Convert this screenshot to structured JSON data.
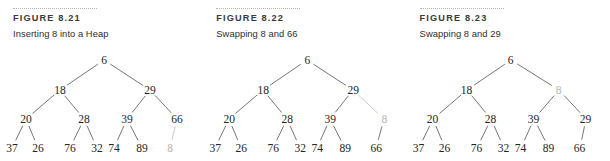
{
  "page": {
    "background_color": "#ffffff",
    "ink_color": "#232323",
    "ghost_color": "#b6b2ad",
    "edge_color": "#5d5d5d",
    "rule_color": "#b9b4ac"
  },
  "figures": [
    {
      "label": "FIGURE 8.21",
      "caption": "Inserting 8 into a Heap",
      "tree": {
        "nodes": [
          {
            "id": "n0",
            "value": "6",
            "x": 104,
            "y": 8,
            "ghost": false
          },
          {
            "id": "n1",
            "value": "18",
            "x": 60,
            "y": 38,
            "ghost": false
          },
          {
            "id": "n2",
            "value": "29",
            "x": 150,
            "y": 38,
            "ghost": false
          },
          {
            "id": "n3",
            "value": "20",
            "x": 26,
            "y": 67,
            "ghost": false
          },
          {
            "id": "n4",
            "value": "28",
            "x": 84,
            "y": 67,
            "ghost": false
          },
          {
            "id": "n5",
            "value": "39",
            "x": 127,
            "y": 67,
            "ghost": false
          },
          {
            "id": "n6",
            "value": "66",
            "x": 177,
            "y": 67,
            "ghost": false
          },
          {
            "id": "n7",
            "value": "37",
            "x": 12,
            "y": 96,
            "ghost": false
          },
          {
            "id": "n8",
            "value": "26",
            "x": 38,
            "y": 96,
            "ghost": false
          },
          {
            "id": "n9",
            "value": "76",
            "x": 70,
            "y": 96,
            "ghost": false
          },
          {
            "id": "n10",
            "value": "32",
            "x": 97,
            "y": 96,
            "ghost": false
          },
          {
            "id": "n11",
            "value": "74",
            "x": 114,
            "y": 96,
            "ghost": false
          },
          {
            "id": "n12",
            "value": "89",
            "x": 142,
            "y": 96,
            "ghost": false
          },
          {
            "id": "n13",
            "value": "8",
            "x": 170,
            "y": 96,
            "ghost": true
          }
        ],
        "edges": [
          {
            "from": "n0",
            "to": "n1",
            "ghost": false
          },
          {
            "from": "n0",
            "to": "n2",
            "ghost": false
          },
          {
            "from": "n1",
            "to": "n3",
            "ghost": false
          },
          {
            "from": "n1",
            "to": "n4",
            "ghost": false
          },
          {
            "from": "n2",
            "to": "n5",
            "ghost": false
          },
          {
            "from": "n2",
            "to": "n6",
            "ghost": false
          },
          {
            "from": "n3",
            "to": "n7",
            "ghost": false
          },
          {
            "from": "n3",
            "to": "n8",
            "ghost": false
          },
          {
            "from": "n4",
            "to": "n9",
            "ghost": false
          },
          {
            "from": "n4",
            "to": "n10",
            "ghost": false
          },
          {
            "from": "n5",
            "to": "n11",
            "ghost": false
          },
          {
            "from": "n5",
            "to": "n12",
            "ghost": false
          },
          {
            "from": "n6",
            "to": "n13",
            "ghost": true
          }
        ]
      }
    },
    {
      "label": "FIGURE 8.22",
      "caption": "Swapping 8 and 66",
      "tree": {
        "nodes": [
          {
            "id": "n0",
            "value": "6",
            "x": 104,
            "y": 8,
            "ghost": false
          },
          {
            "id": "n1",
            "value": "18",
            "x": 60,
            "y": 38,
            "ghost": false
          },
          {
            "id": "n2",
            "value": "29",
            "x": 150,
            "y": 38,
            "ghost": false
          },
          {
            "id": "n3",
            "value": "20",
            "x": 26,
            "y": 67,
            "ghost": false
          },
          {
            "id": "n4",
            "value": "28",
            "x": 84,
            "y": 67,
            "ghost": false
          },
          {
            "id": "n5",
            "value": "39",
            "x": 127,
            "y": 67,
            "ghost": false
          },
          {
            "id": "n6",
            "value": "8",
            "x": 181,
            "y": 67,
            "ghost": true
          },
          {
            "id": "n7",
            "value": "37",
            "x": 12,
            "y": 96,
            "ghost": false
          },
          {
            "id": "n8",
            "value": "26",
            "x": 38,
            "y": 96,
            "ghost": false
          },
          {
            "id": "n9",
            "value": "76",
            "x": 70,
            "y": 96,
            "ghost": false
          },
          {
            "id": "n10",
            "value": "32",
            "x": 97,
            "y": 96,
            "ghost": false
          },
          {
            "id": "n11",
            "value": "74",
            "x": 114,
            "y": 96,
            "ghost": false
          },
          {
            "id": "n12",
            "value": "89",
            "x": 142,
            "y": 96,
            "ghost": false
          },
          {
            "id": "n13",
            "value": "66",
            "x": 173,
            "y": 96,
            "ghost": false
          }
        ],
        "edges": [
          {
            "from": "n0",
            "to": "n1",
            "ghost": false
          },
          {
            "from": "n0",
            "to": "n2",
            "ghost": false
          },
          {
            "from": "n1",
            "to": "n3",
            "ghost": false
          },
          {
            "from": "n1",
            "to": "n4",
            "ghost": false
          },
          {
            "from": "n2",
            "to": "n5",
            "ghost": false
          },
          {
            "from": "n2",
            "to": "n6",
            "ghost": true
          },
          {
            "from": "n3",
            "to": "n7",
            "ghost": false
          },
          {
            "from": "n3",
            "to": "n8",
            "ghost": false
          },
          {
            "from": "n4",
            "to": "n9",
            "ghost": false
          },
          {
            "from": "n4",
            "to": "n10",
            "ghost": false
          },
          {
            "from": "n5",
            "to": "n11",
            "ghost": false
          },
          {
            "from": "n5",
            "to": "n12",
            "ghost": false
          },
          {
            "from": "n6",
            "to": "n13",
            "ghost": false
          }
        ]
      }
    },
    {
      "label": "FIGURE 8.23",
      "caption": "Swapping 8 and 29",
      "tree": {
        "nodes": [
          {
            "id": "n0",
            "value": "6",
            "x": 104,
            "y": 8,
            "ghost": false
          },
          {
            "id": "n1",
            "value": "18",
            "x": 60,
            "y": 38,
            "ghost": false
          },
          {
            "id": "n2",
            "value": "8",
            "x": 152,
            "y": 38,
            "ghost": true
          },
          {
            "id": "n3",
            "value": "20",
            "x": 26,
            "y": 67,
            "ghost": false
          },
          {
            "id": "n4",
            "value": "28",
            "x": 84,
            "y": 67,
            "ghost": false
          },
          {
            "id": "n5",
            "value": "39",
            "x": 127,
            "y": 67,
            "ghost": false
          },
          {
            "id": "n6",
            "value": "29",
            "x": 179,
            "y": 67,
            "ghost": false
          },
          {
            "id": "n7",
            "value": "37",
            "x": 12,
            "y": 96,
            "ghost": false
          },
          {
            "id": "n8",
            "value": "26",
            "x": 38,
            "y": 96,
            "ghost": false
          },
          {
            "id": "n9",
            "value": "76",
            "x": 70,
            "y": 96,
            "ghost": false
          },
          {
            "id": "n10",
            "value": "32",
            "x": 97,
            "y": 96,
            "ghost": false
          },
          {
            "id": "n11",
            "value": "74",
            "x": 114,
            "y": 96,
            "ghost": false
          },
          {
            "id": "n12",
            "value": "89",
            "x": 142,
            "y": 96,
            "ghost": false
          },
          {
            "id": "n13",
            "value": "66",
            "x": 173,
            "y": 96,
            "ghost": false
          }
        ],
        "edges": [
          {
            "from": "n0",
            "to": "n1",
            "ghost": false
          },
          {
            "from": "n0",
            "to": "n2",
            "ghost": false
          },
          {
            "from": "n1",
            "to": "n3",
            "ghost": false
          },
          {
            "from": "n1",
            "to": "n4",
            "ghost": false
          },
          {
            "from": "n2",
            "to": "n5",
            "ghost": false
          },
          {
            "from": "n2",
            "to": "n6",
            "ghost": false
          },
          {
            "from": "n3",
            "to": "n7",
            "ghost": false
          },
          {
            "from": "n3",
            "to": "n8",
            "ghost": false
          },
          {
            "from": "n4",
            "to": "n9",
            "ghost": false
          },
          {
            "from": "n4",
            "to": "n10",
            "ghost": false
          },
          {
            "from": "n5",
            "to": "n11",
            "ghost": false
          },
          {
            "from": "n5",
            "to": "n12",
            "ghost": false
          },
          {
            "from": "n6",
            "to": "n13",
            "ghost": false
          }
        ]
      }
    }
  ]
}
